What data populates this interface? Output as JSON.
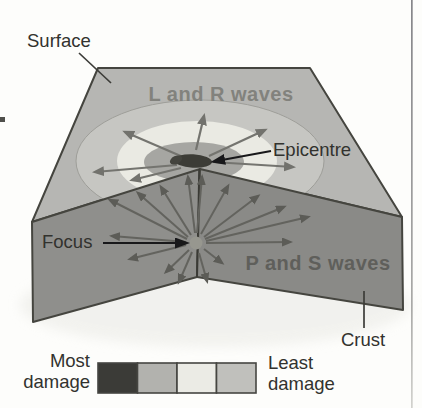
{
  "diagram": {
    "labels": {
      "surface": "Surface",
      "l_r_waves": "L and R waves",
      "epicentre": "Epicentre",
      "focus": "Focus",
      "p_s_waves": "P and S waves",
      "crust": "Crust"
    },
    "legend": {
      "most_line1": "Most",
      "most_line2": "damage",
      "least_line1": "Least",
      "least_line2": "damage",
      "cells": [
        {
          "name": "most-damage-swatch",
          "color": "#3b3b37"
        },
        {
          "name": "high-damage-swatch",
          "color": "#b2b2ae"
        },
        {
          "name": "medium-damage-swatch",
          "color": "#ebebe5"
        },
        {
          "name": "least-damage-swatch",
          "color": "#c0c0bc"
        }
      ]
    },
    "colors": {
      "surface_face": "#b6b6b3",
      "left_face": "#8f8f8c",
      "right_face": "#8a8a87",
      "ring_inner": "#a6a6a2",
      "ring_middle": "#eaeae3",
      "ring_outer": "#c6c6c2",
      "epicentre_spot": "#3c3c36",
      "label_text": "#32322e",
      "wave_text_surface": "#82827d",
      "wave_text_face": "#5f5f5b"
    }
  }
}
